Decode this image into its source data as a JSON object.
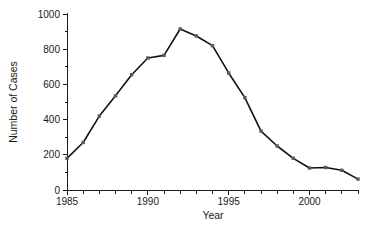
{
  "chart_data": {
    "type": "line",
    "title": "",
    "xlabel": "Year",
    "ylabel": "Number of Cases",
    "xlim": [
      1985,
      2003
    ],
    "ylim": [
      0,
      1000
    ],
    "grid": false,
    "legend": null,
    "x_tick_labels": [
      "1985",
      "1990",
      "1995",
      "2000"
    ],
    "x_tick_values": [
      1985,
      1990,
      1995,
      2000
    ],
    "x_minor_ticks": [
      1986,
      1987,
      1988,
      1989,
      1991,
      1992,
      1993,
      1994,
      1996,
      1997,
      1998,
      1999,
      2001,
      2002,
      2003
    ],
    "y_tick_labels": [
      "0",
      "200",
      "400",
      "600",
      "800",
      "1000"
    ],
    "y_tick_values": [
      0,
      200,
      400,
      600,
      800,
      1000
    ],
    "y_minor_ticks": [
      100,
      300,
      500,
      700,
      900
    ],
    "x": [
      1985,
      1986,
      1987,
      1988,
      1989,
      1990,
      1991,
      1992,
      1993,
      1994,
      1995,
      1996,
      1997,
      1998,
      1999,
      2000,
      2001,
      2002,
      2003
    ],
    "values": [
      180,
      270,
      420,
      535,
      655,
      750,
      765,
      915,
      875,
      820,
      665,
      525,
      335,
      250,
      180,
      125,
      128,
      112,
      62
    ],
    "series": [
      {
        "name": "Number of Cases",
        "values": [
          180,
          270,
          420,
          535,
          655,
          750,
          765,
          915,
          875,
          820,
          665,
          525,
          335,
          250,
          180,
          125,
          128,
          112,
          62
        ]
      }
    ],
    "line_color": "#111111",
    "marker_color": "#5a5a5a",
    "background_color": "#ffffff"
  },
  "axes": {
    "x_title": "Year",
    "y_title": "Number of Cases"
  }
}
